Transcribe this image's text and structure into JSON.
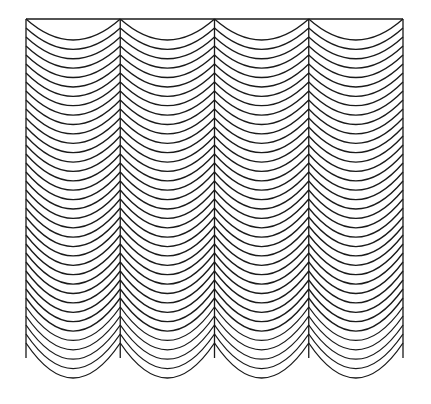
{
  "figure": {
    "columns": 4,
    "bounds": {
      "left": 26,
      "right": 403,
      "top": 19,
      "side_bottom": 358
    },
    "column_dividers_x": [
      26,
      120.25,
      214.5,
      308.75,
      403
    ],
    "arcs_per_column": 37,
    "arc_spacing_px": 9,
    "arc_depth_top": 21,
    "arc_depth_bottom": 35,
    "stroke_color": "#1a1a1a",
    "background_color": "#ffffff"
  }
}
